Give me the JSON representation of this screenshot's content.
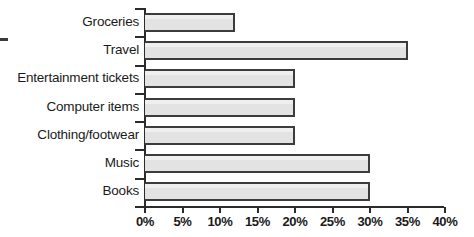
{
  "chart_data": {
    "type": "bar",
    "orientation": "horizontal",
    "title": "",
    "subtitle": "",
    "xlabel": "",
    "ylabel": "",
    "categories": [
      "Groceries",
      "Travel",
      "Entertainment tickets",
      "Computer items",
      "Clothing/footwear",
      "Music",
      "Books"
    ],
    "values": [
      12,
      35,
      20,
      20,
      20,
      30,
      30
    ],
    "value_unit": "%",
    "xlim": [
      0,
      40
    ],
    "xticks": [
      0,
      5,
      10,
      15,
      20,
      25,
      30,
      35,
      40
    ],
    "xtick_labels": [
      "0%",
      "5%",
      "10%",
      "15%",
      "20%",
      "25%",
      "30%",
      "35%",
      "40%"
    ],
    "grid": false,
    "legend": null,
    "bar_fill_color": "#e3e3e3",
    "bar_border_color": "#3c3c3c",
    "axis_color": "#2b2b2b",
    "background_color": "#ffffff"
  }
}
